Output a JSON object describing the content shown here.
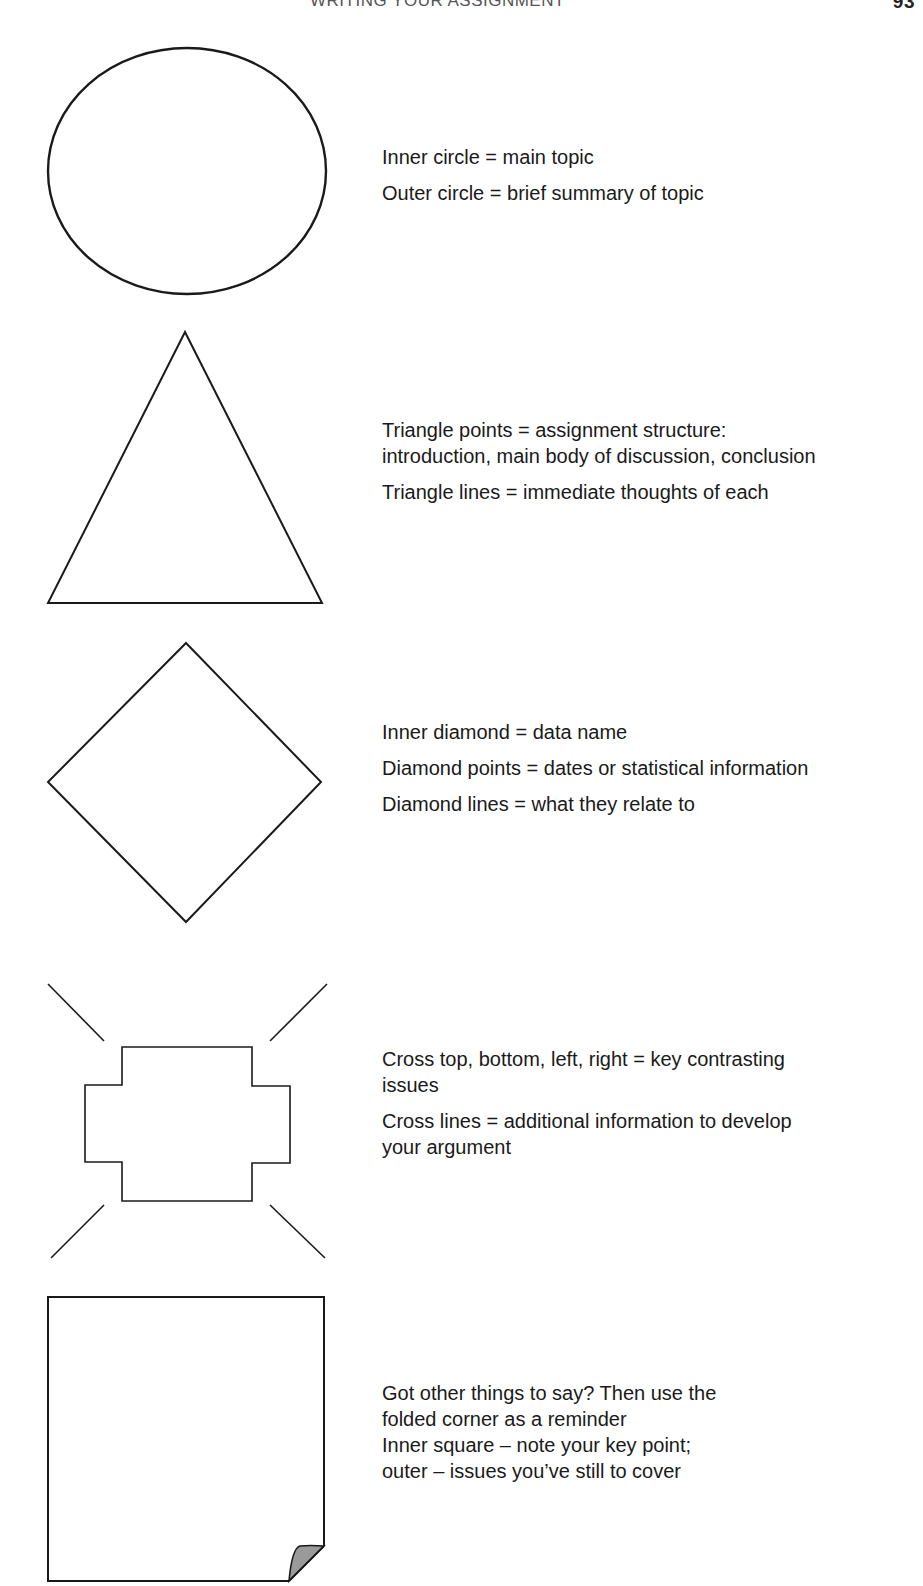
{
  "header": {
    "running_title": "WRITING YOUR ASSIGNMENT",
    "page_number": "93"
  },
  "shapes": [
    {
      "shape": "circle",
      "captions": [
        "Inner circle = main topic",
        "Outer circle = brief summary of topic"
      ]
    },
    {
      "shape": "triangle",
      "captions": [
        "Triangle points = assignment structure:\nintroduction, main body of discussion, conclusion",
        "Triangle lines = immediate thoughts of each"
      ]
    },
    {
      "shape": "diamond",
      "captions": [
        "Inner diamond = data name",
        "Diamond points = dates or statistical information",
        "Diamond lines = what they relate to"
      ]
    },
    {
      "shape": "cross",
      "captions": [
        "Cross top, bottom, left, right = key contrasting\nissues",
        "Cross lines = additional information to develop\nyour argument"
      ]
    },
    {
      "shape": "folded-square",
      "captions": [
        "Got other things to say? Then use the",
        "folded corner as a reminder",
        "Inner square – note your key point;",
        "outer – issues you’ve still to cover"
      ]
    }
  ],
  "colors": {
    "stroke": "#1a1a1a",
    "fold_fill": "#9a9a9a",
    "text": "#1a1a1a"
  }
}
